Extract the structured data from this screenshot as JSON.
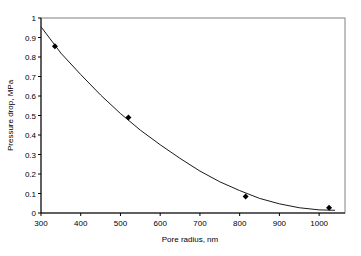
{
  "chart_data": {
    "type": "scatter",
    "title": "",
    "xlabel": "Pore radius, nm",
    "ylabel": "Pressure drop, MPa",
    "xlim": [
      300,
      1050
    ],
    "ylim": [
      0,
      1
    ],
    "xticks": [
      300,
      400,
      500,
      600,
      700,
      800,
      900,
      1000
    ],
    "yticks": [
      0,
      0.1,
      0.2,
      0.3,
      0.4,
      0.5,
      0.6,
      0.7,
      0.8,
      0.9,
      1
    ],
    "grid": false,
    "legend": null,
    "series": [
      {
        "name": "Measured",
        "marker": "diamond",
        "color": "#000000",
        "x": [
          335,
          520,
          815,
          1025
        ],
        "y": [
          0.855,
          0.49,
          0.085,
          0.027
        ]
      },
      {
        "name": "Polynomial fit",
        "style": "line",
        "color": "#000000",
        "x": [
          300,
          350,
          400,
          450,
          500,
          550,
          600,
          650,
          700,
          750,
          800,
          850,
          900,
          950,
          1000,
          1040
        ],
        "y": [
          0.955,
          0.82,
          0.71,
          0.605,
          0.51,
          0.425,
          0.35,
          0.28,
          0.215,
          0.16,
          0.115,
          0.075,
          0.047,
          0.027,
          0.016,
          0.014
        ]
      }
    ]
  }
}
